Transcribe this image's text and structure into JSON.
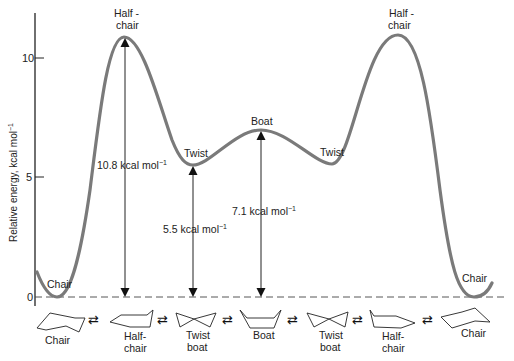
{
  "diagram": {
    "type": "energy-profile",
    "y_axis": {
      "label": "Relative energy, kcal mol",
      "label_sup": "−1",
      "ticks": [
        "0",
        "5",
        "10"
      ]
    },
    "curve_color": "#7a7a7a",
    "states": [
      {
        "name": "Chair",
        "energy": 0
      },
      {
        "name_line1": "Half -",
        "name_line2": "chair",
        "energy": 10.8
      },
      {
        "name": "Twist",
        "energy": 5.5
      },
      {
        "name": "Boat",
        "energy": 7.1
      },
      {
        "name": "Twist",
        "energy": 5.5
      },
      {
        "name_line1": "Half -",
        "name_line2": "chair",
        "energy": 10.8
      },
      {
        "name": "Chair",
        "energy": 0
      }
    ],
    "annotations": [
      {
        "value": "10.8 kcal mol",
        "sup": "−1"
      },
      {
        "value": "5.5 kcal mol",
        "sup": "−1"
      },
      {
        "value": "7.1 kcal mol",
        "sup": "−1"
      }
    ],
    "conformers": [
      {
        "line1": "Chair",
        "line2": ""
      },
      {
        "line1": "Half-",
        "line2": "chair"
      },
      {
        "line1": "Twist",
        "line2": "boat"
      },
      {
        "line1": "Boat",
        "line2": ""
      },
      {
        "line1": "Twist",
        "line2": "boat"
      },
      {
        "line1": "Half-",
        "line2": "chair"
      },
      {
        "line1": "Chair",
        "line2": ""
      }
    ],
    "equilibrium_symbol": "⇄"
  }
}
